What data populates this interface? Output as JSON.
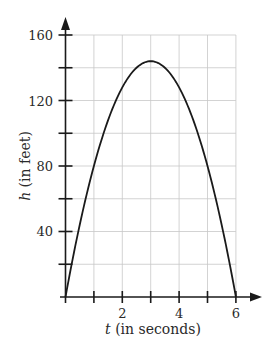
{
  "chart_data": {
    "type": "line",
    "title": "",
    "xlabel_var": "t",
    "xlabel_rest": " (in seconds)",
    "ylabel_var": "h",
    "ylabel_rest": " (in feet)",
    "xlim": [
      0,
      6
    ],
    "ylim": [
      0,
      160
    ],
    "x_ticks": [
      0,
      1,
      2,
      3,
      4,
      5,
      6
    ],
    "x_tick_labels": [
      {
        "value": 2,
        "label": "2"
      },
      {
        "value": 4,
        "label": "4"
      },
      {
        "value": 6,
        "label": "6"
      }
    ],
    "y_ticks": [
      0,
      20,
      40,
      60,
      80,
      100,
      120,
      140,
      160
    ],
    "y_tick_labels": [
      {
        "value": 40,
        "label": "40"
      },
      {
        "value": 80,
        "label": "80"
      },
      {
        "value": 120,
        "label": "120"
      },
      {
        "value": 160,
        "label": "160"
      }
    ],
    "grid": true,
    "legend": null,
    "series": [
      {
        "name": "h(t)",
        "description": "parabolic height vs time, peak 144 ft at t=3 s, zeros at t=0 and t=6",
        "x": [
          0,
          0.5,
          1,
          1.5,
          2,
          2.5,
          3,
          3.5,
          4,
          4.5,
          5,
          5.5,
          6
        ],
        "values": [
          0,
          44,
          80,
          108,
          128,
          140,
          144,
          140,
          128,
          108,
          80,
          44,
          0
        ]
      }
    ]
  },
  "labels": {
    "x_axis": "t (in seconds)",
    "y_axis": "h (in feet)",
    "x_tick_2": "2",
    "x_tick_4": "4",
    "x_tick_6": "6",
    "y_tick_40": "40",
    "y_tick_80": "80",
    "y_tick_120": "120",
    "y_tick_160": "160"
  }
}
